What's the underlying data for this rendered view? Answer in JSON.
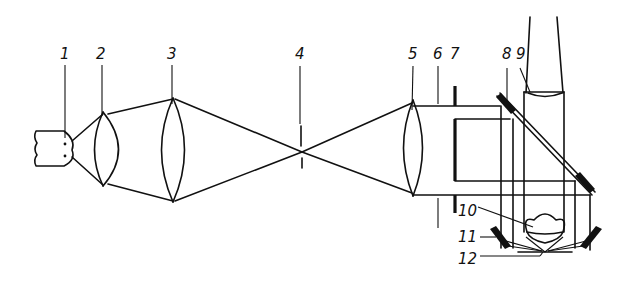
{
  "diagram": {
    "type": "optical-schematic",
    "stroke_color": "#111111",
    "background": "#ffffff",
    "labels": [
      {
        "id": "1",
        "text": "1",
        "component": "light-source"
      },
      {
        "id": "2",
        "text": "2",
        "component": "condenser-lens-1"
      },
      {
        "id": "3",
        "text": "3",
        "component": "condenser-lens-2"
      },
      {
        "id": "4",
        "text": "4",
        "component": "aperture-diaphragm"
      },
      {
        "id": "5",
        "text": "5",
        "component": "collimating-lens"
      },
      {
        "id": "6",
        "text": "6",
        "component": "parallel-beam"
      },
      {
        "id": "7",
        "text": "7",
        "component": "annular-stop"
      },
      {
        "id": "8",
        "text": "8",
        "component": "upper-annular-mirror"
      },
      {
        "id": "9",
        "text": "9",
        "component": "objective-lens"
      },
      {
        "id": "10",
        "text": "10",
        "component": "objective-front"
      },
      {
        "id": "11",
        "text": "11",
        "component": "lower-annular-mirror"
      },
      {
        "id": "12",
        "text": "12",
        "component": "specimen"
      }
    ]
  }
}
